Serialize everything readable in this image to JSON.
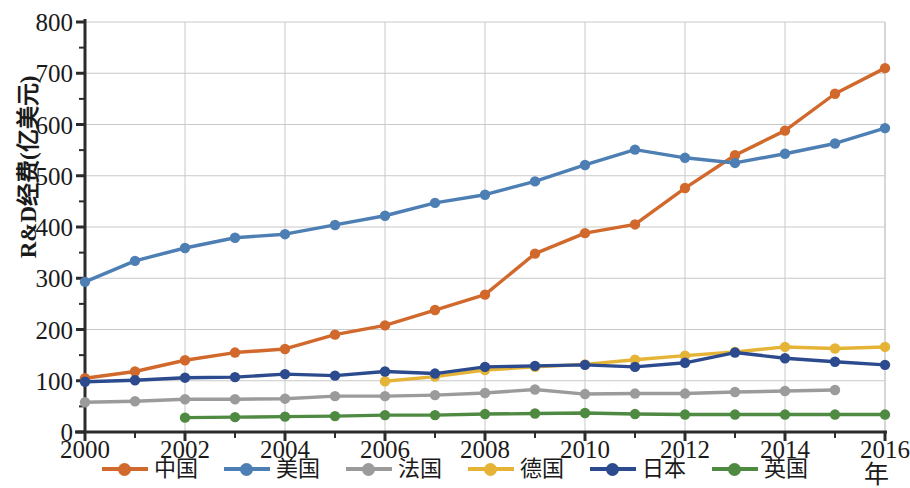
{
  "chart_data": {
    "type": "line",
    "title": "",
    "xlabel": "年",
    "ylabel": "R&D经费(亿美元)",
    "x": [
      2000,
      2001,
      2002,
      2003,
      2004,
      2005,
      2006,
      2007,
      2008,
      2009,
      2010,
      2011,
      2012,
      2013,
      2014,
      2015,
      2016
    ],
    "xticks": [
      "2000",
      "2002",
      "2004",
      "2006",
      "2008",
      "2010",
      "2012",
      "2014",
      "2016"
    ],
    "yticks": [
      "0",
      "100",
      "200",
      "300",
      "400",
      "500",
      "600",
      "700",
      "800"
    ],
    "xlim": [
      2000,
      2016
    ],
    "ylim": [
      0,
      800
    ],
    "grid": true,
    "legend_position": "bottom",
    "series": [
      {
        "name": "中国",
        "color": "#D2692C",
        "x": [
          2000,
          2001,
          2002,
          2003,
          2004,
          2005,
          2006,
          2007,
          2008,
          2009,
          2010,
          2011,
          2012,
          2013,
          2014,
          2015,
          2016
        ],
        "values": [
          105,
          118,
          140,
          155,
          162,
          190,
          208,
          238,
          268,
          348,
          388,
          405,
          476,
          540,
          588,
          660,
          710
        ]
      },
      {
        "name": "美国",
        "color": "#4E7FB4",
        "x": [
          2000,
          2001,
          2002,
          2003,
          2004,
          2005,
          2006,
          2007,
          2008,
          2009,
          2010,
          2011,
          2012,
          2013,
          2014,
          2015,
          2016
        ],
        "values": [
          293,
          334,
          359,
          379,
          386,
          404,
          422,
          447,
          463,
          489,
          521,
          551,
          535,
          525,
          543,
          563,
          593
        ]
      },
      {
        "name": "法国",
        "color": "#9B9B9B",
        "x": [
          2000,
          2001,
          2002,
          2003,
          2004,
          2005,
          2006,
          2007,
          2008,
          2009,
          2010,
          2011,
          2012,
          2013,
          2014,
          2015
        ],
        "values": [
          58,
          60,
          64,
          64,
          65,
          70,
          70,
          72,
          76,
          83,
          74,
          75,
          75,
          78,
          80,
          82
        ]
      },
      {
        "name": "德国",
        "color": "#E5B437",
        "x": [
          2006,
          2007,
          2008,
          2009,
          2010,
          2011,
          2012,
          2013,
          2014,
          2015,
          2016
        ],
        "values": [
          99,
          108,
          121,
          127,
          132,
          141,
          149,
          156,
          166,
          163,
          166
        ]
      },
      {
        "name": "日本",
        "color": "#2C4A8E",
        "x": [
          2000,
          2001,
          2002,
          2003,
          2004,
          2005,
          2006,
          2007,
          2008,
          2009,
          2010,
          2011,
          2012,
          2013,
          2014,
          2015,
          2016
        ],
        "values": [
          98,
          101,
          106,
          107,
          113,
          110,
          118,
          114,
          127,
          129,
          131,
          127,
          135,
          155,
          144,
          137,
          131
        ]
      },
      {
        "name": "英国",
        "color": "#4F8A42",
        "x": [
          2002,
          2003,
          2004,
          2005,
          2006,
          2007,
          2008,
          2009,
          2010,
          2011,
          2012,
          2013,
          2014,
          2015,
          2016
        ],
        "values": [
          28,
          29,
          30,
          31,
          33,
          33,
          35,
          36,
          37,
          35,
          34,
          34,
          34,
          34,
          34
        ]
      }
    ]
  },
  "legend": {
    "items": [
      {
        "label": "中国"
      },
      {
        "label": "美国"
      },
      {
        "label": "法国"
      },
      {
        "label": "德国"
      },
      {
        "label": "日本"
      },
      {
        "label": "英国"
      }
    ]
  }
}
